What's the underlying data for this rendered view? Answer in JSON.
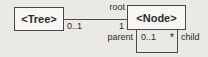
{
  "diagram": {
    "type": "uml-class-diagram",
    "classes": [
      {
        "id": "tree",
        "name": "<Tree>"
      },
      {
        "id": "node",
        "name": "<Node>"
      }
    ],
    "associations": [
      {
        "id": "tree-node",
        "from": "<Tree>",
        "to": "<Node>",
        "from_multiplicity": "0..1",
        "to_role": "root",
        "to_multiplicity": "1"
      },
      {
        "id": "node-self",
        "from": "<Node>",
        "to": "<Node>",
        "from_role": "parent",
        "from_multiplicity": "0..1",
        "to_multiplicity": "*",
        "to_role": "child"
      }
    ],
    "labels": {
      "root_role": "root",
      "root_multiplicity": "1",
      "tree_multiplicity": "0..1",
      "parent_role": "parent",
      "parent_multiplicity": "0..1",
      "child_multiplicity": "*",
      "child_role": "child"
    },
    "colors": {
      "background": "#eae9e5",
      "box_fill": "#f7f6f2",
      "line": "#4a4a48",
      "text": "#2b2b29"
    }
  }
}
